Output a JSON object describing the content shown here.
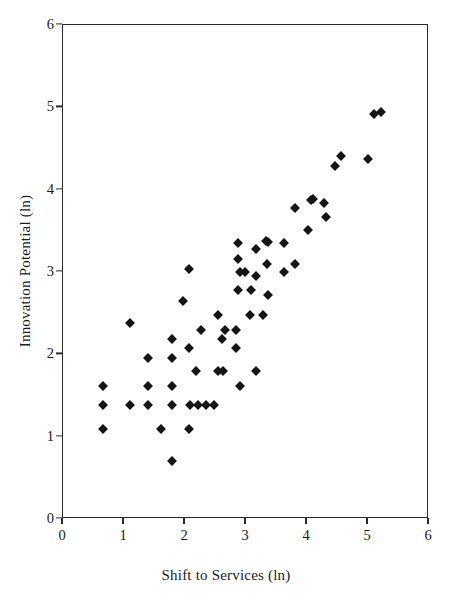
{
  "chart_data": {
    "type": "scatter",
    "title": "",
    "xlabel": "Shift to Services (ln)",
    "ylabel": "Innovation Potential (ln)",
    "xlim": [
      0,
      6
    ],
    "ylim": [
      0,
      6
    ],
    "xticks": [
      0,
      1,
      2,
      3,
      4,
      5,
      6
    ],
    "yticks": [
      0,
      1,
      2,
      3,
      4,
      5,
      6
    ],
    "xtick_labels": [
      "0",
      "1",
      "2",
      "3",
      "4",
      "5",
      "6"
    ],
    "ytick_labels": [
      "0",
      "1",
      "2",
      "3",
      "4",
      "5",
      "6"
    ],
    "grid": false,
    "legend": false,
    "marker": "diamond",
    "marker_color": "#151515",
    "marker_size_px": 7,
    "n_points": 91,
    "series": [
      {
        "name": "Countries",
        "points": [
          [
            0.67,
            1.6
          ],
          [
            0.67,
            1.37
          ],
          [
            0.67,
            1.08
          ],
          [
            1.11,
            2.37
          ],
          [
            1.11,
            1.37
          ],
          [
            1.41,
            1.94
          ],
          [
            1.41,
            1.6
          ],
          [
            1.41,
            1.37
          ],
          [
            1.62,
            1.08
          ],
          [
            1.8,
            2.18
          ],
          [
            1.8,
            1.94
          ],
          [
            1.8,
            1.6
          ],
          [
            1.8,
            1.37
          ],
          [
            1.8,
            0.69
          ],
          [
            1.98,
            2.64
          ],
          [
            2.08,
            3.02
          ],
          [
            2.08,
            2.07
          ],
          [
            2.08,
            1.08
          ],
          [
            2.1,
            1.37
          ],
          [
            2.2,
            1.78
          ],
          [
            2.23,
            1.37
          ],
          [
            2.28,
            2.28
          ],
          [
            2.36,
            1.37
          ],
          [
            2.49,
            1.37
          ],
          [
            2.56,
            2.47
          ],
          [
            2.56,
            1.78
          ],
          [
            2.62,
            2.18
          ],
          [
            2.64,
            1.78
          ],
          [
            2.68,
            2.28
          ],
          [
            2.86,
            2.28
          ],
          [
            2.86,
            2.07
          ],
          [
            2.88,
            3.34
          ],
          [
            2.88,
            3.15
          ],
          [
            2.88,
            2.77
          ],
          [
            2.92,
            2.99
          ],
          [
            2.92,
            1.6
          ],
          [
            3.0,
            2.99
          ],
          [
            3.08,
            2.47
          ],
          [
            3.1,
            2.77
          ],
          [
            3.18,
            3.27
          ],
          [
            3.18,
            2.94
          ],
          [
            3.18,
            1.78
          ],
          [
            3.3,
            2.47
          ],
          [
            3.34,
            3.36
          ],
          [
            3.38,
            3.35
          ],
          [
            3.36,
            3.08
          ],
          [
            3.38,
            2.71
          ],
          [
            3.64,
            3.34
          ],
          [
            3.64,
            2.99
          ],
          [
            3.82,
            3.76
          ],
          [
            3.82,
            3.08
          ],
          [
            4.04,
            3.5
          ],
          [
            4.08,
            3.86
          ],
          [
            4.12,
            3.88
          ],
          [
            4.3,
            3.83
          ],
          [
            4.32,
            3.66
          ],
          [
            4.48,
            4.27
          ],
          [
            4.58,
            4.4
          ],
          [
            5.02,
            4.36
          ],
          [
            5.11,
            4.91
          ],
          [
            5.23,
            4.93
          ]
        ]
      }
    ]
  },
  "axes": {
    "x_tick_values": [
      "0",
      "1",
      "2",
      "3",
      "4",
      "5",
      "6"
    ],
    "y_tick_values": [
      "0",
      "1",
      "2",
      "3",
      "4",
      "5",
      "6"
    ]
  }
}
